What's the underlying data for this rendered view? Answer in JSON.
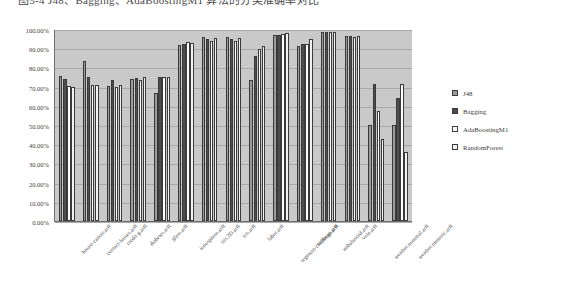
{
  "caption": {
    "text": "图5-4 J48、Bagging、AdaBoostingM1 算法的分类准确率对比"
  },
  "legend": {
    "position": "right",
    "entries": [
      {
        "label": "J48",
        "color": "#9b9b9b"
      },
      {
        "label": "Bagging",
        "color": "#4d4d4d"
      },
      {
        "label": "AdaBoostingM1",
        "color": "#fdfdfd"
      },
      {
        "label": "RandomForest",
        "color": "#f2f2f2"
      }
    ]
  },
  "yaxis": {
    "ticks": [
      "0.00%",
      "10.00%",
      "20.00%",
      "30.00%",
      "40.00%",
      "50.00%",
      "60.00%",
      "70.00%",
      "80.00%",
      "90.00%",
      "100.00%"
    ]
  },
  "chart_data": {
    "type": "bar",
    "title": "",
    "xlabel": "",
    "ylabel": "",
    "ylim": [
      0,
      100
    ],
    "grid": true,
    "legend_position": "right",
    "categories": [
      "breast-cancer.arff",
      "contact-lenses.arff",
      "credit-g.arff",
      "diabetes.arff",
      "glass.arff",
      "ionosphere.arff",
      "iris.2D.arff",
      "iris.arff",
      "labor.arff",
      "segment-challenge.arff",
      "soybean.arff",
      "unbalanced.arff",
      "vote.arff",
      "weather.nominal.arff",
      "weather.numeric.arff"
    ],
    "series": [
      {
        "name": "J48",
        "values": [
          75.52,
          83.33,
          70.5,
          73.83,
          66.82,
          91.45,
          96.0,
          96.0,
          73.68,
          96.7,
          91.38,
          98.62,
          96.32,
          50.0,
          50.0
        ]
      },
      {
        "name": "Bagging",
        "values": [
          74.13,
          75.0,
          73.5,
          74.61,
          74.77,
          92.31,
          94.67,
          94.67,
          86.0,
          97.0,
          92.41,
          98.62,
          96.32,
          71.43,
          64.29
        ]
      },
      {
        "name": "AdaBoostingM1",
        "values": [
          70.28,
          70.83,
          70.0,
          73.31,
          75.23,
          93.16,
          94.0,
          94.0,
          89.47,
          97.6,
          92.41,
          98.62,
          95.63,
          57.14,
          71.43
        ]
      },
      {
        "name": "RandomForest",
        "values": [
          69.58,
          70.83,
          71.0,
          75.13,
          75.23,
          92.88,
          95.33,
          95.33,
          91.23,
          97.9,
          94.71,
          98.62,
          96.32,
          42.86,
          35.71
        ]
      }
    ]
  }
}
